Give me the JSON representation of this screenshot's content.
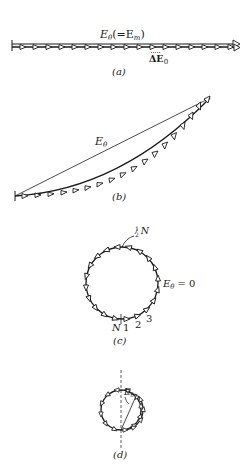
{
  "panels": {
    "a": {
      "caption": "(a)",
      "resultant_label": "Eθ(=Em)",
      "resultant_main": "E",
      "resultant_sub": "θ",
      "resultant_suffix": "(=E",
      "resultant_suffix_sub": "m",
      "resultant_close": ")",
      "element_label": "ΔE",
      "element_sub": "0"
    },
    "b": {
      "caption": "(b)",
      "resultant_main": "E",
      "resultant_sub": "θ"
    },
    "c": {
      "caption": "(c)",
      "half_label": "½N",
      "half_num": "1",
      "half_den": "2",
      "half_N": "N",
      "zero_main": "E",
      "zero_sub": "θ",
      "zero_eq": "= 0",
      "index_N": "N",
      "index_1": "1",
      "index_2": "2",
      "index_3": "3"
    },
    "d": {
      "caption": "(d)",
      "resultant_main": "E",
      "resultant_sub": "θ"
    }
  },
  "colors": {
    "ink": "#1a1a1a",
    "background": "#ffffff"
  }
}
